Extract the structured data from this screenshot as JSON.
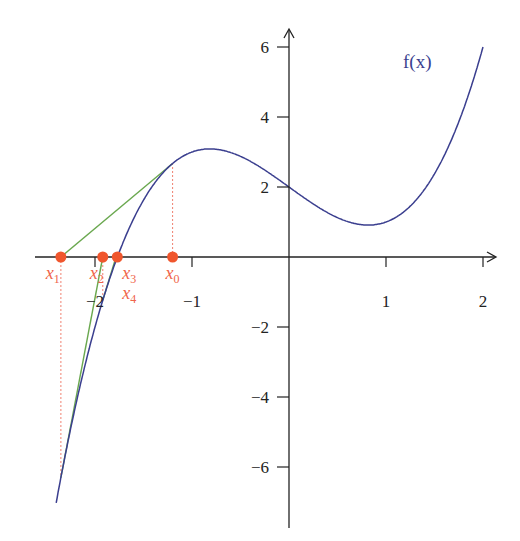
{
  "chart_data": {
    "type": "line",
    "title": "",
    "function_label": "f(x)",
    "function": "x^3 - 2x + 2",
    "xlim": [
      -2.4,
      2.05
    ],
    "ylim": [
      -7.8,
      6.5
    ],
    "x_ticks": [
      -2,
      -1,
      1,
      2
    ],
    "x_tick_labels": [
      "−2",
      "−1",
      "1",
      "2"
    ],
    "y_ticks": [
      -6,
      -4,
      -2,
      2,
      4,
      6
    ],
    "y_tick_labels": [
      "−6",
      "−4",
      "−2",
      "2",
      "4",
      "6"
    ],
    "grid": false,
    "newton_points": [
      {
        "label": "x",
        "sub": "0",
        "x": -1.2
      },
      {
        "label": "x",
        "sub": "1",
        "x": -2.352
      },
      {
        "label": "x",
        "sub": "2",
        "x": -1.92
      },
      {
        "label": "x",
        "sub": "3",
        "x": -1.77
      },
      {
        "label": "x",
        "sub": "4",
        "x": -1.77
      }
    ],
    "colors": {
      "curve": "#3b3f8f",
      "tangent": "#6aa84f",
      "points": "#f0562d",
      "guides": "#f08070",
      "axis": "#222222"
    }
  }
}
